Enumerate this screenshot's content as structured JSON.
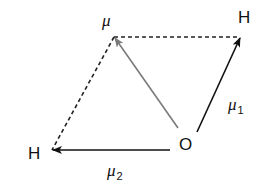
{
  "diagram": {
    "type": "vector-diagram",
    "atoms": {
      "oxygen": {
        "label": "O",
        "x": 179,
        "y": 136
      },
      "hydrogen_right": {
        "label": "H",
        "x": 238,
        "y": 9
      },
      "hydrogen_left": {
        "label": "H",
        "x": 28,
        "y": 145
      }
    },
    "vectors": {
      "mu1": {
        "label": "μ",
        "subscript": "1",
        "from": [
          197,
          132
        ],
        "to": [
          240,
          37
        ],
        "color": "#111111"
      },
      "mu2": {
        "label": "μ",
        "subscript": "2",
        "from": [
          170,
          150
        ],
        "to": [
          52,
          150
        ],
        "color": "#111111"
      },
      "resultant": {
        "label": "μ",
        "subscript": "",
        "from": [
          178,
          128
        ],
        "to": [
          114,
          37
        ],
        "color": "#7a7a7a"
      }
    },
    "dashed_lines": [
      {
        "from": [
          114,
          37
        ],
        "to": [
          240,
          37
        ]
      },
      {
        "from": [
          114,
          37
        ],
        "to": [
          52,
          150
        ]
      }
    ],
    "colors": {
      "line": "#111111",
      "resultant": "#7a7a7a",
      "background": "#ffffff"
    }
  }
}
